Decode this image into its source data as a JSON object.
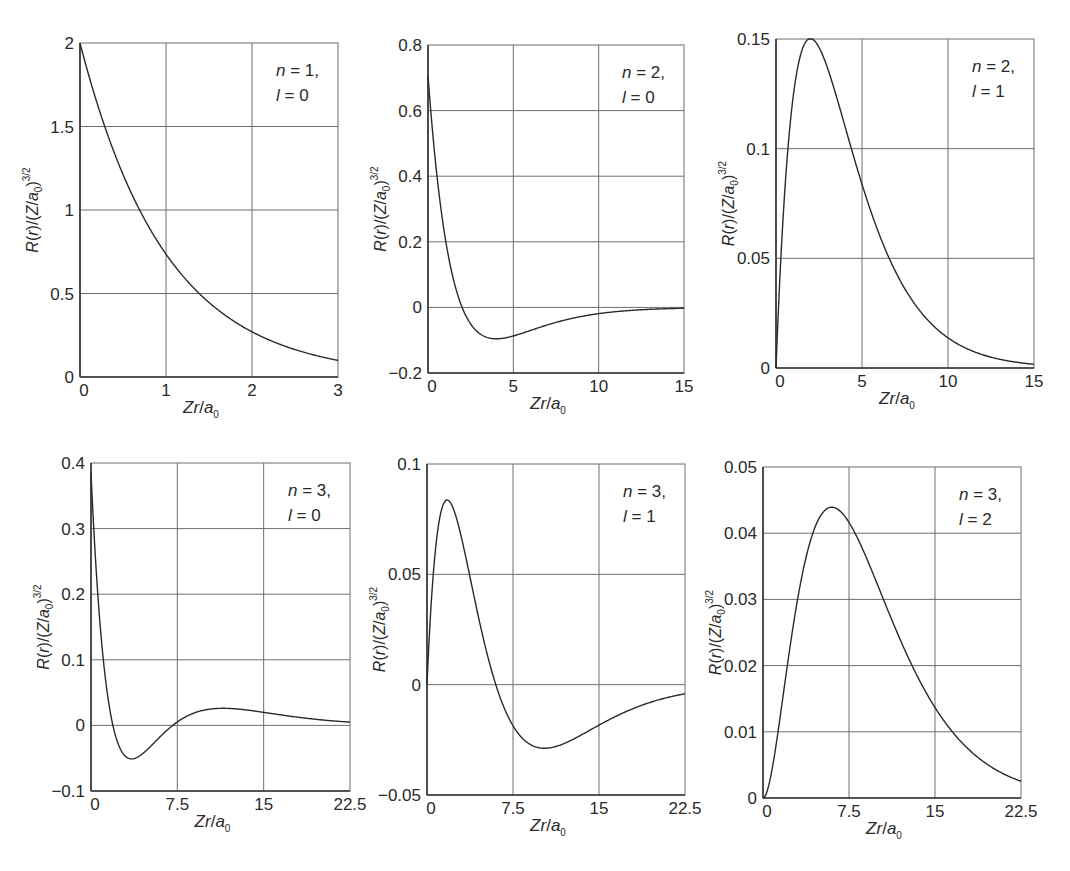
{
  "figure": {
    "line_color": "#2a2a2a",
    "grid_color": "#6e6e6e",
    "background": "#ffffff"
  },
  "chart_data": [
    {
      "type": "line",
      "id": "n1l0",
      "annotation": [
        "n = 1,",
        "l = 0"
      ],
      "n": 1,
      "l": 0,
      "xlabel": "Zr/a0",
      "ylabel": "R(r)/(Z/a0)^3/2",
      "xlim": [
        0,
        3
      ],
      "ylim": [
        0,
        2
      ],
      "xticks": [
        0,
        1,
        2,
        3
      ],
      "xtick_labels": [
        "0",
        "1",
        "2",
        "3"
      ],
      "yticks": [
        0,
        0.5,
        1,
        1.5,
        2
      ],
      "ytick_labels": [
        "0",
        "0.5",
        "1",
        "1.5",
        "2"
      ],
      "grid": true,
      "box": [
        80,
        43,
        338,
        377
      ],
      "series": [
        {
          "name": "R10",
          "x": [
            0,
            0.25,
            0.5,
            0.75,
            1,
            1.25,
            1.5,
            1.75,
            2,
            2.25,
            2.5,
            2.75,
            3
          ],
          "y": [
            2,
            1.558,
            1.213,
            0.945,
            0.736,
            0.573,
            0.446,
            0.348,
            0.271,
            0.211,
            0.164,
            0.128,
            0.1
          ]
        }
      ]
    },
    {
      "type": "line",
      "id": "n2l0",
      "annotation": [
        "n = 2,",
        "l = 0"
      ],
      "n": 2,
      "l": 0,
      "xlabel": "Zr/a0",
      "ylabel": "R(r)/(Z/a0)^3/2",
      "xlim": [
        0,
        15
      ],
      "ylim": [
        -0.2,
        0.8
      ],
      "xticks": [
        0,
        5,
        10,
        15
      ],
      "xtick_labels": [
        "0",
        "5",
        "10",
        "15"
      ],
      "yticks": [
        -0.2,
        0,
        0.2,
        0.4,
        0.6,
        0.8
      ],
      "ytick_labels": [
        "−0.2",
        "0",
        "0.2",
        "0.4",
        "0.6",
        "0.8"
      ],
      "grid": true,
      "box": [
        428,
        45,
        684,
        373
      ],
      "series": [
        {
          "name": "R20",
          "x": [
            0,
            1,
            2,
            3,
            4,
            5,
            6,
            8,
            10,
            12,
            15
          ],
          "y": [
            0.707,
            0.214,
            0,
            -0.079,
            -0.096,
            -0.087,
            -0.07,
            -0.041,
            -0.021,
            -0.01,
            -0.003
          ]
        }
      ]
    },
    {
      "type": "line",
      "id": "n2l1",
      "annotation": [
        "n = 2,",
        "l = 1"
      ],
      "n": 2,
      "l": 1,
      "xlabel": "Zr/a0",
      "ylabel": "R(r)/(Z/a0)^3/2",
      "xlim": [
        0,
        15
      ],
      "ylim": [
        0,
        0.15
      ],
      "xticks": [
        0,
        5,
        10,
        15
      ],
      "xtick_labels": [
        "0",
        "5",
        "10",
        "15"
      ],
      "yticks": [
        0,
        0.05,
        0.1,
        0.15
      ],
      "ytick_labels": [
        "0",
        "0.05",
        "0.1",
        "0.15"
      ],
      "grid": true,
      "box": [
        776,
        39,
        1034,
        368
      ],
      "series": [
        {
          "name": "R21",
          "x": [
            0,
            1,
            2,
            3,
            4,
            5,
            6,
            8,
            10,
            12,
            15
          ],
          "y": [
            0,
            0.124,
            0.15,
            0.137,
            0.11,
            0.083,
            0.061,
            0.03,
            0.014,
            0.006,
            0.002
          ]
        }
      ]
    },
    {
      "type": "line",
      "id": "n3l0",
      "annotation": [
        "n = 3,",
        "l = 0"
      ],
      "n": 3,
      "l": 0,
      "xlabel": "Zr/a0",
      "ylabel": "R(r)/(Z/a0)^3/2",
      "xlim": [
        0,
        22.5
      ],
      "ylim": [
        -0.1,
        0.4
      ],
      "xticks": [
        0,
        7.5,
        15,
        22.5
      ],
      "xtick_labels": [
        "0",
        "7.5",
        "15",
        "22.5"
      ],
      "yticks": [
        -0.1,
        0,
        0.1,
        0.2,
        0.3,
        0.4
      ],
      "ytick_labels": [
        "−0.1",
        "0",
        "0.1",
        "0.2",
        "0.3",
        "0.4"
      ],
      "grid": true,
      "box": [
        91,
        463,
        350,
        791
      ],
      "series": [
        {
          "name": "R30",
          "x": [
            0,
            1,
            2,
            3,
            4,
            5,
            7.1,
            9,
            11,
            13,
            15,
            18,
            22.5
          ],
          "y": [
            0.385,
            0.161,
            0.036,
            -0.026,
            -0.051,
            -0.053,
            0,
            0.023,
            0.027,
            0.023,
            0.017,
            0.009,
            0.003
          ]
        }
      ]
    },
    {
      "type": "line",
      "id": "n3l1",
      "annotation": [
        "n = 3,",
        "l = 1"
      ],
      "n": 3,
      "l": 1,
      "xlabel": "Zr/a0",
      "ylabel": "R(r)/(Z/a0)^3/2",
      "xlim": [
        0,
        22.5
      ],
      "ylim": [
        -0.05,
        0.1
      ],
      "xticks": [
        0,
        7.5,
        15,
        22.5
      ],
      "xtick_labels": [
        "0",
        "7.5",
        "15",
        "22.5"
      ],
      "yticks": [
        -0.05,
        0,
        0.05,
        0.1
      ],
      "ytick_labels": [
        "−0.05",
        "0",
        "0.05",
        "0.1"
      ],
      "grid": true,
      "box": [
        427,
        464,
        685,
        795
      ],
      "series": [
        {
          "name": "R31",
          "x": [
            0,
            1,
            2,
            3,
            4,
            6,
            8,
            10,
            12,
            15,
            18,
            22.5
          ],
          "y": [
            0,
            0.066,
            0.077,
            0.06,
            0.036,
            0,
            -0.021,
            -0.023,
            -0.019,
            -0.011,
            -0.006,
            -0.002
          ]
        }
      ]
    },
    {
      "type": "line",
      "id": "n3l2",
      "annotation": [
        "n = 3,",
        "l = 2"
      ],
      "n": 3,
      "l": 2,
      "xlabel": "Zr/a0",
      "ylabel": "R(r)/(Z/a0)^3/2",
      "xlim": [
        0,
        22.5
      ],
      "ylim": [
        0,
        0.05
      ],
      "xticks": [
        0,
        7.5,
        15,
        22.5
      ],
      "xtick_labels": [
        "0",
        "7.5",
        "15",
        "22.5"
      ],
      "yticks": [
        0,
        0.01,
        0.02,
        0.03,
        0.04,
        0.05
      ],
      "ytick_labels": [
        "0",
        "0.01",
        "0.02",
        "0.03",
        "0.04",
        "0.05"
      ],
      "grid": true,
      "box": [
        763,
        467,
        1021,
        798
      ],
      "series": [
        {
          "name": "R32",
          "x": [
            0,
            2,
            4,
            6,
            8,
            10,
            12,
            15,
            18,
            22.5
          ],
          "y": [
            0,
            0.013,
            0.036,
            0.045,
            0.042,
            0.033,
            0.025,
            0.014,
            0.007,
            0.002
          ]
        }
      ]
    }
  ]
}
